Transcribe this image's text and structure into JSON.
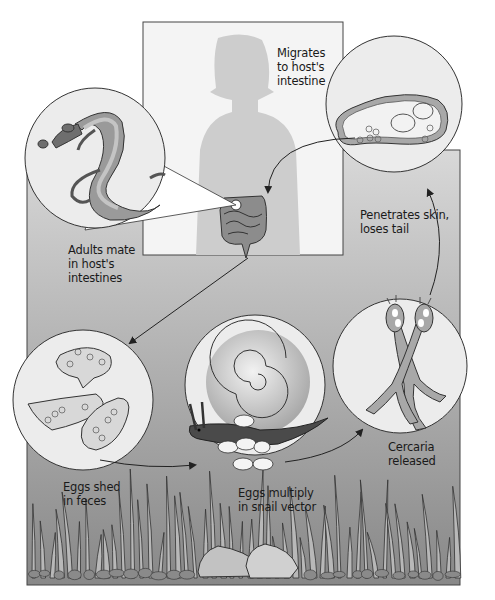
{
  "diagram": {
    "colors": {
      "panel_top": "#d6d6d6",
      "panel_bottom": "#8a8a8a",
      "host_box": "#f4f4f4",
      "silhouette": "#cdcdcd",
      "circle_fill": "#ececec",
      "worm_dark": "#6e6e6e",
      "worm_mid": "#9a9a9a",
      "worm_light": "#c2c2c2",
      "outline": "#333333"
    },
    "stages": [
      {
        "id": "migrates",
        "label": "Migrates\nto host's\nintestine"
      },
      {
        "id": "adults",
        "label": "Adults mate\nin host's\nintestines"
      },
      {
        "id": "penetrates",
        "label": "Penetrates skin,\nloses tail"
      },
      {
        "id": "eggs_shed",
        "label": "Eggs shed\nin feces"
      },
      {
        "id": "eggs_multiply",
        "label": "Eggs multiply\nin snail vector"
      },
      {
        "id": "cercaria",
        "label": "Cercaria\nreleased"
      }
    ]
  }
}
